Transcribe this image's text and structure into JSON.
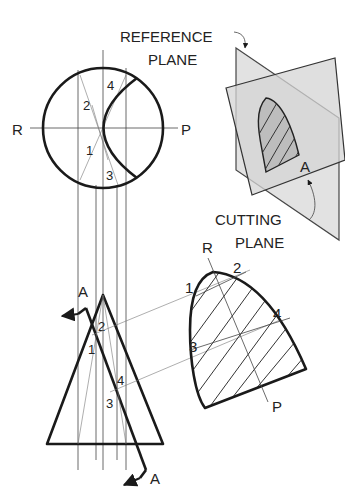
{
  "figure": {
    "labels": {
      "reference_plane_line1": "REFERENCE",
      "reference_plane_line2": "PLANE",
      "cutting_plane_line1": "CUTTING",
      "cutting_plane_line2": "PLANE",
      "axis_left": "R",
      "axis_right": "P",
      "section_mark": "A"
    },
    "top_view": {
      "points": [
        "1",
        "2",
        "3",
        "4"
      ]
    },
    "front_view": {
      "section_arrow_top": "A",
      "section_arrow_bottom": "A",
      "points": [
        "1",
        "2",
        "3",
        "4"
      ]
    },
    "true_shape": {
      "axis_start": "R",
      "axis_end": "P",
      "points": [
        "1",
        "2",
        "3",
        "4"
      ]
    },
    "pictorial": {
      "plane_mark": "A"
    },
    "colors": {
      "line": "#1a1a1a",
      "plane_fill": "#d4d4d4",
      "background": "#ffffff"
    }
  }
}
